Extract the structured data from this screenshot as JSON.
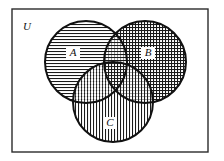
{
  "figure": {
    "kind": "venn-diagram",
    "title": "",
    "background_color": "#ffffff",
    "ink_color": "#111111"
  },
  "universe": {
    "label": "U",
    "name": "universal-set",
    "border_color": "#2b2b2b",
    "border_width_px": 1.4,
    "rect": {
      "x": 12,
      "y": 9,
      "width": 196,
      "height": 143
    },
    "label_position": {
      "x": 27,
      "y": 30
    }
  },
  "sets": [
    {
      "id": "A",
      "label": "A",
      "fill_pattern": "horizontal-lines",
      "pattern_spacing_px": 3,
      "stroke_color": "#111111",
      "stroke_width_px": 2,
      "center": {
        "x": 86,
        "y": 62
      },
      "radius": 41,
      "label_position": {
        "x": 73,
        "y": 56
      }
    },
    {
      "id": "B",
      "label": "B",
      "fill_pattern": "cross-hatch-grid",
      "pattern_spacing_px": 3,
      "stroke_color": "#111111",
      "stroke_width_px": 2,
      "center": {
        "x": 145,
        "y": 62
      },
      "radius": 41,
      "label_position": {
        "x": 148,
        "y": 56
      }
    },
    {
      "id": "C",
      "label": "C",
      "fill_pattern": "vertical-lines",
      "pattern_spacing_px": 3,
      "stroke_color": "#111111",
      "stroke_width_px": 2,
      "center": {
        "x": 113,
        "y": 102
      },
      "radius": 40,
      "label_position": {
        "x": 110,
        "y": 126
      }
    }
  ],
  "regions": {
    "description": "Three mutually overlapping circles inside a rectangle; overlap areas show superimposed hatch patterns.",
    "overlaps": [
      "A and B",
      "A and C",
      "B and C",
      "A and B and C"
    ]
  }
}
